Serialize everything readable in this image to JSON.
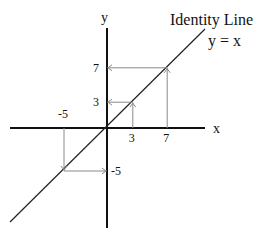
{
  "title": "Identity Line",
  "equation": "y = x",
  "axes": {
    "x_label": "x",
    "y_label": "y"
  },
  "range": {
    "x": [
      -11.5,
      11.5
    ],
    "y": [
      -11.5,
      11.5
    ]
  },
  "colors": {
    "axis": "#111111",
    "identity": "#222222",
    "guide": "#8a8a8a"
  },
  "mappings": [
    {
      "x": 7,
      "y": 7,
      "direction": "to-y-axis",
      "x_label": "7",
      "y_label": "7"
    },
    {
      "x": 3,
      "y": 3,
      "direction": "to-y-axis",
      "x_label": "3",
      "y_label": "3"
    },
    {
      "x": -5,
      "y": -5,
      "direction": "to-y-axis",
      "x_label": "-5",
      "y_label": "-5"
    }
  ]
}
